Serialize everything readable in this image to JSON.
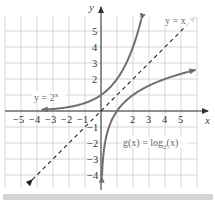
{
  "chart_data": {
    "type": "line",
    "title": "",
    "xlabel": "x",
    "ylabel": "y",
    "xlim": [
      -6,
      6
    ],
    "ylim": [
      -5,
      6
    ],
    "grid": true,
    "x_ticks": [
      "−5",
      "−4",
      "−3",
      "−2",
      "−1",
      "2",
      "3",
      "4",
      "5"
    ],
    "y_ticks": [
      "5",
      "4",
      "3",
      "2",
      "−1",
      "−2",
      "−3",
      "−4"
    ],
    "series": [
      {
        "name": "y = 2^x",
        "label": "y = 2ˣ",
        "style": "solid",
        "color": "#707070",
        "x": [
          -3.7,
          -3,
          -2,
          -1,
          0,
          1,
          2,
          2.5
        ],
        "y": [
          0.077,
          0.125,
          0.25,
          0.5,
          1,
          2,
          4,
          5.66
        ]
      },
      {
        "name": "g(x) = log_2(x)",
        "label": "g(x) = log₂(x)",
        "style": "solid",
        "color": "#707070",
        "x": [
          0.06,
          0.125,
          0.25,
          0.5,
          1,
          2,
          4,
          5.9
        ],
        "y": [
          -4.06,
          -3,
          -2,
          -1,
          0,
          1,
          2,
          2.56
        ]
      },
      {
        "name": "y = x",
        "label": "y = x",
        "style": "dashed",
        "color": "#222222",
        "x": [
          -4.3,
          5.9
        ],
        "y": [
          -4.3,
          5.9
        ]
      }
    ],
    "annotations": [
      "y = 2^x",
      "y = x",
      "g(x) = log_2(x)"
    ]
  },
  "labels": {
    "exp_curve": "y = 2",
    "exp_sup": "x",
    "identity_line": "y = x",
    "log_curve_pre": "g(x) = log",
    "log_sub": "2",
    "log_curve_post": "(x)",
    "x_axis": "x",
    "y_axis": "y"
  },
  "ticks": {
    "x": [
      {
        "v": -5,
        "t": "−5"
      },
      {
        "v": -4,
        "t": "−4"
      },
      {
        "v": -3,
        "t": "−3"
      },
      {
        "v": -2,
        "t": "−2"
      },
      {
        "v": -1,
        "t": "−1"
      },
      {
        "v": 2,
        "t": "2"
      },
      {
        "v": 3,
        "t": "3"
      },
      {
        "v": 4,
        "t": "4"
      },
      {
        "v": 5,
        "t": "5"
      }
    ],
    "y": [
      {
        "v": 5,
        "t": "5"
      },
      {
        "v": 4,
        "t": "4"
      },
      {
        "v": 3,
        "t": "3"
      },
      {
        "v": 2,
        "t": "2"
      },
      {
        "v": -1,
        "t": "−1"
      },
      {
        "v": -2,
        "t": "−2"
      },
      {
        "v": -3,
        "t": "−3"
      },
      {
        "v": -4,
        "t": "−4"
      }
    ]
  },
  "colors": {
    "grid": "#d6d6d6",
    "axis": "#333333",
    "curve": "#707070",
    "dashed": "#222222",
    "band": "#d4d4d4"
  }
}
